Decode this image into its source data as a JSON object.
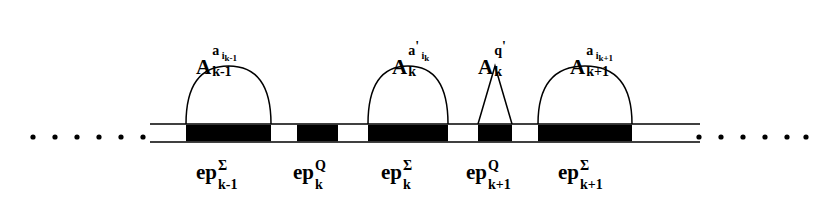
{
  "figure": {
    "type": "diagram",
    "background_color": "#ffffff",
    "stroke_color": "#000000",
    "block_fill_color": "#000000",
    "rail": {
      "x_start": 150,
      "x_end": 700,
      "top_line_y": 124,
      "bottom_line_y": 142,
      "line_width": 1.6
    },
    "ellipsis_left": {
      "name": "left-ellipsis",
      "dot_count": 6,
      "x_positions": [
        33,
        55,
        77,
        99,
        121,
        143
      ],
      "y": 137,
      "radius": 2.6
    },
    "ellipsis_right": {
      "name": "right-ellipsis",
      "dot_count": 6,
      "x_positions": [
        699,
        721,
        743,
        765,
        787,
        806
      ],
      "y": 137,
      "radius": 2.6
    },
    "blocks": [
      {
        "name": "block-epoch-sigma-k-1",
        "x": 186,
        "width": 85,
        "label_key": "ep_sigma_k_1"
      },
      {
        "name": "block-epoch-q-k",
        "x": 297,
        "width": 41,
        "label_key": "ep_q_k"
      },
      {
        "name": "block-epoch-sigma-k",
        "x": 368,
        "width": 80,
        "label_key": "ep_sigma_k"
      },
      {
        "name": "block-epoch-q-k+1",
        "x": 478,
        "width": 34,
        "label_key": "ep_q_k1"
      },
      {
        "name": "block-epoch-sigma-k+1",
        "x": 538,
        "width": 94,
        "label_key": "ep_sigma_k1"
      }
    ],
    "arches": [
      {
        "name": "arch-a-i-k-1",
        "shape": "dome",
        "x_left": 186,
        "x_right": 271,
        "apex_y": 66
      },
      {
        "name": "arch-a-i-k",
        "shape": "dome",
        "x_left": 368,
        "x_right": 448,
        "apex_y": 66
      },
      {
        "name": "arch-q-prime",
        "shape": "triangle",
        "x_left": 478,
        "x_right": 512,
        "apex_y": 66
      },
      {
        "name": "arch-a-i-k+1",
        "shape": "dome",
        "x_left": 538,
        "x_right": 632,
        "apex_y": 66
      }
    ]
  },
  "top_labels": [
    {
      "name": "label-A-k-1",
      "base": "A",
      "superscript": "a",
      "superscript_sub": "i",
      "superscript_subsub": "k-1",
      "subscript": "k-1",
      "prime": "",
      "x": 196,
      "y": 57
    },
    {
      "name": "label-A-k",
      "base": "A",
      "superscript": "a",
      "superscript_sub": "i",
      "superscript_subsub": "k",
      "subscript": "k",
      "prime": "'",
      "x": 392,
      "y": 57
    },
    {
      "name": "label-A-k-q-prime",
      "base": "A",
      "superscript": "q",
      "superscript_sub": "",
      "superscript_subsub": "",
      "subscript": "k",
      "prime": "'",
      "x": 478,
      "y": 57
    },
    {
      "name": "label-A-k+1",
      "base": "A",
      "superscript": "a",
      "superscript_sub": "i",
      "superscript_subsub": "k+1",
      "subscript": "k+1",
      "prime": "",
      "x": 570,
      "y": 57
    }
  ],
  "bottom_labels": [
    {
      "name": "label-ep-sigma-k-1",
      "key": "ep_sigma_k_1",
      "base": "ep",
      "superscript": "Σ",
      "subscript": "k-1",
      "x": 196,
      "y": 160
    },
    {
      "name": "label-ep-q-k",
      "key": "ep_q_k",
      "base": "ep",
      "superscript": "Q",
      "subscript": "k",
      "x": 293,
      "y": 160
    },
    {
      "name": "label-ep-sigma-k",
      "key": "ep_sigma_k",
      "base": "ep",
      "superscript": "Σ",
      "subscript": "k",
      "x": 381,
      "y": 160
    },
    {
      "name": "label-ep-q-k+1",
      "key": "ep_q_k1",
      "base": "ep",
      "superscript": "Q",
      "subscript": "k+1",
      "x": 466,
      "y": 160
    },
    {
      "name": "label-ep-sigma-k+1",
      "key": "ep_sigma_k1",
      "base": "ep",
      "superscript": "Σ",
      "subscript": "k+1",
      "x": 558,
      "y": 160
    }
  ]
}
